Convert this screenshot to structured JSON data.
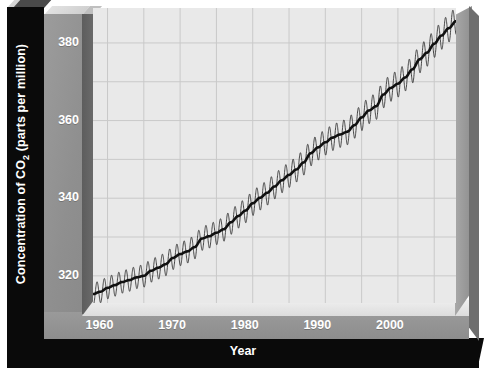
{
  "chart_data": {
    "type": "line",
    "title": "",
    "xlabel": "Year",
    "ylabel_prefix": "Concentration of CO",
    "ylabel_sub": "2",
    "ylabel_suffix": " (parts per million)",
    "ylabel_full": "Concentration of CO2 (parts per million)",
    "xlim": [
      1958,
      2008
    ],
    "ylim": [
      313,
      389
    ],
    "xticks": [
      1960,
      1970,
      1980,
      1990,
      2000
    ],
    "xtick_labels": [
      "1960",
      "1970",
      "1980",
      "1990",
      "2000"
    ],
    "x_minor_step": 5,
    "yticks": [
      320,
      340,
      360,
      380
    ],
    "ytick_labels": [
      "320",
      "340",
      "360",
      "380"
    ],
    "y_minor_step": 10,
    "grid": true,
    "legend": "none",
    "series": [
      {
        "name": "Monthly mean CO2 (seasonal oscillation)",
        "style": "thin-oscillating",
        "color": "#2b2b2b",
        "seasonal_amplitude_ppm": 3.2
      },
      {
        "name": "Smoothed trend",
        "style": "thick-trend",
        "color": "#111111"
      }
    ],
    "x": [
      1958,
      1959,
      1960,
      1961,
      1962,
      1963,
      1964,
      1965,
      1966,
      1967,
      1968,
      1969,
      1970,
      1971,
      1972,
      1973,
      1974,
      1975,
      1976,
      1977,
      1978,
      1979,
      1980,
      1981,
      1982,
      1983,
      1984,
      1985,
      1986,
      1987,
      1988,
      1989,
      1990,
      1991,
      1992,
      1993,
      1994,
      1995,
      1996,
      1997,
      1998,
      1999,
      2000,
      2001,
      2002,
      2003,
      2004,
      2005,
      2006,
      2007,
      2008
    ],
    "values": [
      315.3,
      315.9,
      316.9,
      317.6,
      318.4,
      318.9,
      319.6,
      320.0,
      321.3,
      322.1,
      323.0,
      324.6,
      325.6,
      326.3,
      327.4,
      329.6,
      330.2,
      331.1,
      332.0,
      333.8,
      335.4,
      336.8,
      338.7,
      340.1,
      341.4,
      343.0,
      344.6,
      346.0,
      347.4,
      349.2,
      351.6,
      353.1,
      354.4,
      355.6,
      356.4,
      357.1,
      358.8,
      360.8,
      362.6,
      363.7,
      366.7,
      368.4,
      369.5,
      371.1,
      373.2,
      375.8,
      377.5,
      379.8,
      381.9,
      383.8,
      385.6
    ],
    "panel_background": "#e9e9e9",
    "grid_color": "#c9c9c9",
    "frame_black": "#0a0a0a",
    "frame_grey": "#949494",
    "tick_text_color": "#ffffff"
  }
}
